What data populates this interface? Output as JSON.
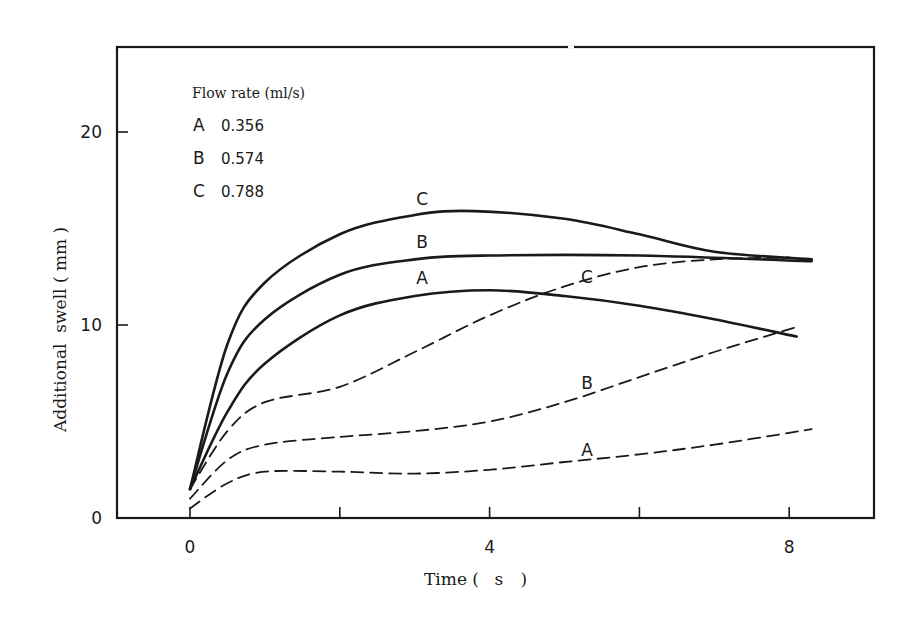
{
  "chart_data": {
    "type": "line",
    "title": "",
    "xlabel": "Time ( s )",
    "ylabel": "Additional swell ( mm )",
    "xlim": [
      -1,
      9.2
    ],
    "ylim": [
      0,
      24.5
    ],
    "x_ticks": [
      0,
      2,
      4,
      6,
      8
    ],
    "x_tick_labels": [
      "0",
      "",
      "4",
      "",
      "8"
    ],
    "y_ticks": [
      0,
      10,
      20
    ],
    "y_tick_labels": [
      "0",
      "10",
      "20"
    ],
    "grid": false,
    "legend": {
      "title": "Flow rate (ml/s)",
      "position": "upper-left",
      "entries": [
        {
          "key": "A",
          "value": "0.356"
        },
        {
          "key": "B",
          "value": "0.574"
        },
        {
          "key": "C",
          "value": "0.788"
        }
      ]
    },
    "series": [
      {
        "name": "C (solid)",
        "style": "solid",
        "label": "C",
        "x": [
          0,
          0.5,
          1,
          2,
          3,
          3.8,
          5,
          6,
          7,
          8.3
        ],
        "y": [
          1.5,
          9,
          12.2,
          14.7,
          15.7,
          15.9,
          15.5,
          14.7,
          13.8,
          13.4
        ]
      },
      {
        "name": "B (solid)",
        "style": "solid",
        "label": "B",
        "x": [
          0,
          0.5,
          1,
          2,
          3,
          4,
          6,
          8.3
        ],
        "y": [
          1.5,
          7.5,
          10.3,
          12.6,
          13.4,
          13.6,
          13.6,
          13.3
        ]
      },
      {
        "name": "A (solid)",
        "style": "solid",
        "label": "A",
        "x": [
          0,
          0.5,
          1,
          2,
          3,
          4,
          5,
          6,
          7,
          8.1
        ],
        "y": [
          1.5,
          5.5,
          8,
          10.5,
          11.5,
          11.8,
          11.5,
          11,
          10.3,
          9.4
        ]
      },
      {
        "name": "C (dashed)",
        "style": "dashed",
        "label": "C",
        "x": [
          0,
          0.5,
          1,
          2,
          3,
          4,
          5,
          6,
          7,
          8
        ],
        "y": [
          1.5,
          4.5,
          6,
          6.8,
          8.6,
          10.5,
          12,
          13,
          13.4,
          13.5
        ]
      },
      {
        "name": "B (dashed)",
        "style": "dashed",
        "label": "B",
        "x": [
          0,
          0.5,
          1,
          2,
          3,
          4,
          5,
          6,
          7,
          8.1
        ],
        "y": [
          1,
          3,
          3.8,
          4.2,
          4.5,
          5,
          6,
          7.3,
          8.6,
          9.9
        ]
      },
      {
        "name": "A (dashed)",
        "style": "dashed",
        "label": "A",
        "x": [
          0,
          0.5,
          1,
          2,
          3,
          4,
          5,
          6,
          7,
          8.3
        ],
        "y": [
          0.5,
          1.8,
          2.4,
          2.4,
          2.3,
          2.5,
          2.9,
          3.3,
          3.8,
          4.6
        ]
      }
    ],
    "annotations": [
      {
        "text": "C",
        "x": 3.1,
        "y": 16.2
      },
      {
        "text": "B",
        "x": 3.1,
        "y": 14.0
      },
      {
        "text": "A",
        "x": 3.1,
        "y": 12.1
      },
      {
        "text": "C",
        "x": 5.3,
        "y": 12.2
      },
      {
        "text": "B",
        "x": 5.3,
        "y": 6.7
      },
      {
        "text": "A",
        "x": 5.3,
        "y": 3.2
      }
    ]
  },
  "labels": {
    "xlabel_main": "Time (",
    "xlabel_unit": "s",
    "xlabel_close": ")",
    "ylabel": "Additional  swell ( mm )",
    "legend_title": "Flow  rate  (ml/s)"
  }
}
